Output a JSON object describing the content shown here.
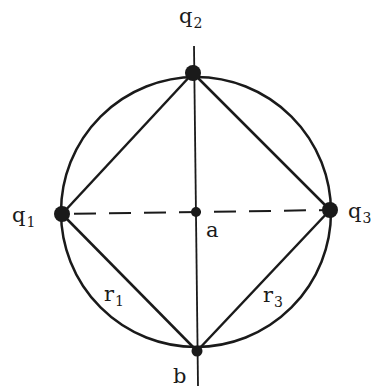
{
  "diagram": {
    "type": "geometry",
    "stroke_color": "#1a1a1a",
    "circle": {
      "cx": 196,
      "cy": 212,
      "r": 135
    },
    "nodes": [
      {
        "id": "q1",
        "label": "q",
        "sub": "1",
        "x": 62,
        "y": 214
      },
      {
        "id": "q2",
        "label": "q",
        "sub": "2",
        "x": 193,
        "y": 73
      },
      {
        "id": "q3",
        "label": "q",
        "sub": "3",
        "x": 330,
        "y": 210
      },
      {
        "id": "a",
        "label": "a",
        "x": 196,
        "y": 212
      },
      {
        "id": "b",
        "label": "b",
        "x": 197,
        "y": 351
      }
    ],
    "edges": [
      {
        "from": "q1",
        "to": "q2",
        "style": "solid"
      },
      {
        "from": "q2",
        "to": "q3",
        "style": "solid"
      },
      {
        "from": "q1",
        "to": "b",
        "style": "solid",
        "label": "r1"
      },
      {
        "from": "q3",
        "to": "b",
        "style": "solid",
        "label": "r3"
      },
      {
        "from": "q1",
        "to": "q3",
        "style": "dashed"
      },
      {
        "from": "q2-axis-top",
        "to": "b-axis-bottom",
        "style": "solid"
      }
    ],
    "labels": {
      "q1": {
        "main": "q",
        "sub": "1"
      },
      "q2": {
        "main": "q",
        "sub": "2"
      },
      "q3": {
        "main": "q",
        "sub": "3"
      },
      "a": "a",
      "b": "b",
      "r1": {
        "main": "r",
        "sub": "1"
      },
      "r3": {
        "main": "r",
        "sub": "3"
      }
    }
  }
}
